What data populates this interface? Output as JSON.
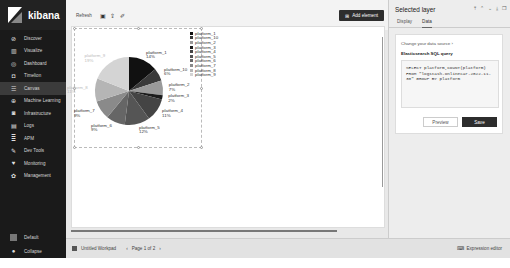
{
  "sidebar": {
    "brand": "kibana",
    "items": [
      {
        "label": "Discover",
        "icon": "compass-icon"
      },
      {
        "label": "Visualize",
        "icon": "chart-icon"
      },
      {
        "label": "Dashboard",
        "icon": "dashboard-icon"
      },
      {
        "label": "Timelion",
        "icon": "timelion-icon"
      },
      {
        "label": "Canvas",
        "icon": "canvas-icon",
        "active": true
      },
      {
        "label": "Machine Learning",
        "icon": "ml-icon"
      },
      {
        "label": "Infrastructure",
        "icon": "infrastructure-icon"
      },
      {
        "label": "Logs",
        "icon": "logs-icon"
      },
      {
        "label": "APM",
        "icon": "apm-icon"
      },
      {
        "label": "Dev Tools",
        "icon": "wrench-icon"
      },
      {
        "label": "Monitoring",
        "icon": "heartbeat-icon"
      },
      {
        "label": "Management",
        "icon": "gear-icon"
      }
    ],
    "bottom": {
      "space_label": "Default",
      "collapse_label": "Collapse"
    }
  },
  "toolbar": {
    "refresh_label": "Refresh",
    "add_element_label": "Add element"
  },
  "footer": {
    "workpad_name": "Untitled Workpad",
    "page_label": "Page 1 of 2",
    "expression_editor_label": "Expression editor"
  },
  "panel": {
    "title": "Selected layer",
    "tabs": [
      "Display",
      "Data"
    ],
    "active_tab": "Data",
    "change_source_label": "Change your data source",
    "source_title": "Elasticsearch SQL query",
    "sql_query": "SELECT platform,COUNT(platform)\nFROM \"logstash-onlinecar-2022-11-30\" GROUP BY platform",
    "preview_label": "Preview",
    "save_label": "Save"
  },
  "chart_data": {
    "type": "pie",
    "title": "",
    "categories": [
      "platform_1",
      "platform_10",
      "platform_2",
      "platform_3",
      "platform_4",
      "platform_5",
      "platform_6",
      "platform_7",
      "platform_8",
      "platform_9"
    ],
    "values": [
      14,
      6,
      7,
      2,
      11,
      12,
      9,
      9,
      11,
      19
    ],
    "labels": [
      "14%",
      "6%",
      "7%",
      "2%",
      "11%",
      "12%",
      "9%",
      "9%",
      "11%",
      "19%"
    ],
    "colors": [
      "#111111",
      "#3a3a3a",
      "#9a9a9a",
      "#1c1c1c",
      "#444444",
      "#555555",
      "#666666",
      "#8a8a8a",
      "#b5b5b5",
      "#d4d4d4"
    ],
    "legend_position": "right",
    "unit": "percent"
  }
}
